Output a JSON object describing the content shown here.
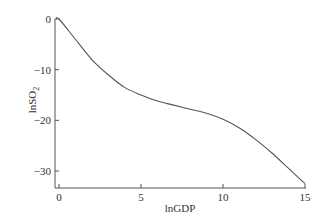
{
  "chart_data": {
    "type": "line",
    "title": "",
    "xlabel": "lnGDP",
    "ylabel": "lnSO",
    "ylabel_sub": "2",
    "xlim": [
      0,
      15
    ],
    "ylim": [
      -33,
      0
    ],
    "xticks": [
      "0",
      "5",
      "10",
      "15"
    ],
    "yticks": [
      "0",
      "-10",
      "-20",
      "-30"
    ],
    "grid": false,
    "legend": null,
    "series": [
      {
        "name": "lnSO2",
        "x": [
          0,
          1,
          2,
          3,
          4,
          5,
          6,
          7,
          8,
          9,
          10,
          11,
          12,
          13,
          14,
          15
        ],
        "values": [
          0,
          -4,
          -8,
          -11,
          -13.5,
          -15,
          -16.2,
          -17,
          -17.8,
          -18.6,
          -19.8,
          -21.5,
          -23.8,
          -26.5,
          -29.5,
          -32.5
        ]
      }
    ]
  }
}
